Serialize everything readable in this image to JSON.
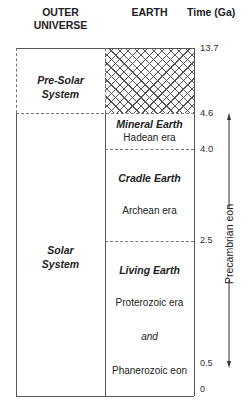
{
  "headers": {
    "outer_universe": "OUTER\nUNIVERSE",
    "outer_universe_line1": "OUTER",
    "outer_universe_line2": "UNIVERSE",
    "earth": "EARTH",
    "time": "Time (Ga)"
  },
  "outer_universe_column": {
    "pre_solar": {
      "line1": "Pre-Solar",
      "line2": "System"
    },
    "solar": {
      "line1": "Solar",
      "line2": "System"
    }
  },
  "earth_column": {
    "pre_earth_fill": "cross-hatch",
    "mineral_earth": {
      "title": "Mineral Earth",
      "era": "Hadean era"
    },
    "cradle_earth": {
      "title": "Cradle Earth",
      "era": "Archean era"
    },
    "living_earth": {
      "title": "Living Earth",
      "era": "Proterozoic era",
      "conjunction": "and",
      "eon": "Phanerozoic eon"
    }
  },
  "time_ticks": [
    "13.7",
    "4.6",
    "4.0",
    "2.5",
    "0.5",
    "0"
  ],
  "precambrian": {
    "label": "Precambrian eon",
    "arrow": "double-headed-vertical-arrow"
  },
  "colors": {
    "line": "#555555",
    "text": "#222222",
    "hatch": "#555555",
    "background": "#ffffff"
  }
}
